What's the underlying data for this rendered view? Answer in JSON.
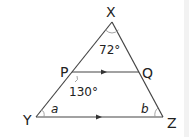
{
  "diagram": {
    "type": "triangle-parallel-lines",
    "colors": {
      "line": "#444444",
      "text": "#222222",
      "background": "#ffffff"
    },
    "vertices": {
      "X": {
        "label": "X"
      },
      "Y": {
        "label": "Y"
      },
      "Z": {
        "label": "Z"
      },
      "P": {
        "label": "P"
      },
      "Q": {
        "label": "Q"
      }
    },
    "angles": {
      "X": "72°",
      "P": "130°",
      "Y": "a",
      "Z": "b"
    },
    "parallel_segments": [
      "PQ",
      "YZ"
    ]
  }
}
